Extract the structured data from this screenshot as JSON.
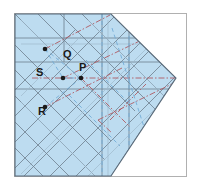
{
  "figure": {
    "type": "geometric-diagram",
    "canvas": {
      "width": 201,
      "height": 192
    },
    "frame": {
      "name": "outer-frame",
      "x": 14,
      "y": 13,
      "width": 172,
      "height": 163,
      "stroke": "#b0b0b0",
      "fill": "#ffffff"
    },
    "shape": {
      "name": "paper-polygon",
      "description": "Rectangle with pointed right vertex (house-on-its-side outline)",
      "fill": "#bddcf0",
      "stroke": "#5a6b7a",
      "points": "15,14 111,14 176,78 111,176 15,176"
    },
    "colors": {
      "paper_fill": "#bddcf0",
      "paper_edge": "#5a6b7a",
      "crease_gray": "#6d7f8e",
      "crease_light": "#9fb9cb",
      "mountain_red": "#b05a62",
      "valley_blue": "#74add7",
      "frame_gray": "#b0b0b0",
      "label_black": "#1a1a1a",
      "background": "#ffffff"
    },
    "legend_hint": {
      "solid_gray": "existing crease",
      "dash_dot_red": "mountain fold",
      "dashed_blue": "valley fold"
    },
    "points": [
      {
        "id": "Q",
        "label": "Q",
        "dot_x": 45,
        "dot_y": 49,
        "label_x": 63,
        "label_y": 58
      },
      {
        "id": "S",
        "label": "S",
        "dot_x": 63,
        "dot_y": 78,
        "label_x": 36,
        "label_y": 76
      },
      {
        "id": "P",
        "label": "P",
        "dot_x": 81,
        "dot_y": 78,
        "label_x": 79,
        "label_y": 71
      },
      {
        "id": "R",
        "label": "R",
        "dot_x": 45,
        "dot_y": 107,
        "label_x": 38,
        "label_y": 115
      }
    ],
    "dot_radius": 2.3,
    "gray_creases": [
      "15,38 176,38",
      "15,62 176,62",
      "15,89 176,89",
      "15,14 111,110",
      "38,14 135,111",
      "60,14 157,111",
      "82,14 176,108",
      "15,45 111,141",
      "15,70 105,160",
      "15,96 95,176",
      "15,122 69,176",
      "15,148 43,176",
      "15,90 75,30",
      "15,116 117,14",
      "15,142 137,20",
      "15,168 150,33",
      "24,176 160,40",
      "50,176 170,56",
      "76,176 176,76",
      "111,14 176,78",
      "111,176 176,78",
      "102,14 102,176",
      "129,30 129,176",
      "64,14 64,62"
    ],
    "red_dashdot": [
      "45,49 110,15",
      "32,78 176,78",
      "63,78 150,36",
      "45,107 122,68",
      "98,120 176,82",
      "110,120 146,84",
      "81,78 130,127",
      "98,120 112,133"
    ],
    "blue_dashed": [
      "45,49 63,78",
      "63,78 81,78",
      "81,78 45,107",
      "102,14 102,176",
      "112,28 145,130",
      "86,60 132,106",
      "69,95 120,146",
      "129,36 129,160",
      "45,49 81,78"
    ]
  }
}
